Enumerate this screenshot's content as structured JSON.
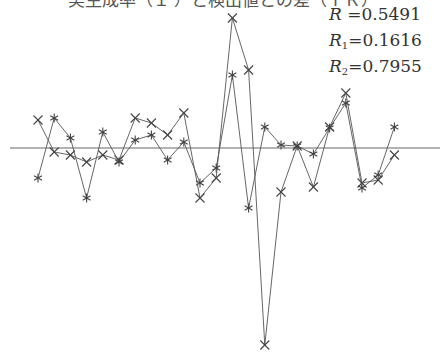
{
  "chart_data": {
    "type": "line",
    "title": "実生成率（Ｉ'）と検出値との差（ＴＲ）",
    "xlabel": "",
    "ylabel": "",
    "grid": false,
    "legend": "none",
    "zero_line": true,
    "x": [
      1,
      2,
      3,
      4,
      5,
      6,
      7,
      8,
      9,
      10,
      11,
      12,
      13,
      14,
      15,
      16,
      17,
      18,
      19,
      20,
      21,
      22,
      23
    ],
    "ylim": [
      -10,
      6.6
    ],
    "series": [
      {
        "name": "series-x-marker",
        "marker": "x",
        "values": [
          1.4,
          -0.2,
          -0.35,
          -0.7,
          -0.35,
          -0.6,
          1.5,
          1.25,
          0.65,
          1.75,
          -2.5,
          -1.5,
          6.5,
          3.9,
          -9.85,
          -2.2,
          0.1,
          -1.95,
          1.05,
          2.75,
          -1.75,
          -1.6,
          -0.35
        ]
      },
      {
        "name": "series-asterisk-marker",
        "marker": "*",
        "values": [
          -1.5,
          1.5,
          0.5,
          -2.5,
          0.8,
          -0.7,
          0.4,
          0.65,
          -0.6,
          0.3,
          -1.75,
          -1.0,
          3.65,
          -3.0,
          1.05,
          0.15,
          0.1,
          -0.3,
          1.0,
          2.25,
          -2.0,
          -1.35,
          1.05
        ]
      }
    ],
    "annotations": [
      {
        "label": "R",
        "sub": "",
        "value": "0.5491"
      },
      {
        "label": "R",
        "sub": "1",
        "value": "0.1616"
      },
      {
        "label": "R",
        "sub": "2",
        "value": "0.7955"
      }
    ]
  }
}
